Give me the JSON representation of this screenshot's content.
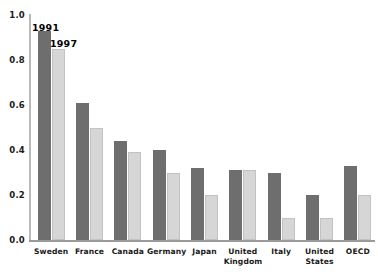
{
  "chart_data": {
    "type": "bar",
    "title": "",
    "xlabel": "",
    "ylabel": "",
    "ylim": [
      0.0,
      1.0
    ],
    "yticks": [
      "0.0",
      "0.2",
      "0.4",
      "0.6",
      "0.8",
      "1.0"
    ],
    "ytick_values": [
      0.0,
      0.2,
      0.4,
      0.6,
      0.8,
      1.0
    ],
    "grid": false,
    "legend_position": "inline-annotation",
    "categories": [
      "Sweden",
      "France",
      "Canada",
      "Germany",
      "Japan",
      "United Kingdom",
      "Italy",
      "United States",
      "OECD"
    ],
    "series": [
      {
        "name": "1991",
        "color": "#6e6e6e",
        "values": [
          0.93,
          0.61,
          0.44,
          0.4,
          0.32,
          0.31,
          0.3,
          0.2,
          0.33
        ]
      },
      {
        "name": "1997",
        "color": "#d6d6d6",
        "values": [
          0.85,
          0.5,
          0.39,
          0.3,
          0.2,
          0.31,
          0.1,
          0.1,
          0.2
        ]
      }
    ],
    "annotations": [
      {
        "text": "1991",
        "series": "1991"
      },
      {
        "text": "1997",
        "series": "1997"
      }
    ]
  }
}
